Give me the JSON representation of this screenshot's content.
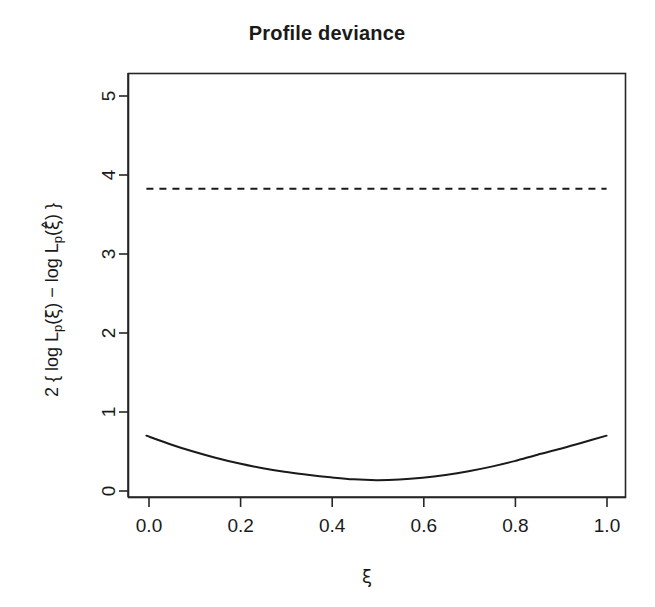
{
  "figure": {
    "title": "Profile deviance",
    "background_color": "#ffffff",
    "foreground_color": "#1a1a1a"
  },
  "axes": {
    "x_label_parts": {
      "symbol": "ξ"
    },
    "y_label_parts": {
      "p1": "2 { log L",
      "sub1": "p",
      "p2": "(",
      "g1": "ξ",
      "p3": ") − log L",
      "sub2": "p",
      "p4": "(",
      "g2": "ξ̂",
      "p5": ") }"
    },
    "x_ticks": [
      "0.0",
      "0.2",
      "0.4",
      "0.6",
      "0.8",
      "1.0"
    ],
    "y_ticks": [
      "0",
      "1",
      "2",
      "3",
      "4",
      "5"
    ]
  },
  "annotations": {
    "reference_line_label": "chi-square 95% critical value"
  },
  "chart_data": {
    "type": "line",
    "title": "Profile deviance",
    "xlabel": "ξ",
    "ylabel": "2 { log L_p(ξ) − log L_p(ξ̂) }",
    "xlim": [
      -0.04,
      1.04
    ],
    "ylim": [
      -0.18,
      5.35
    ],
    "xticks": [
      0.0,
      0.2,
      0.4,
      0.6,
      0.8,
      1.0
    ],
    "yticks": [
      0,
      1,
      2,
      3,
      4,
      5
    ],
    "xticklabels": [
      "0.0",
      "0.2",
      "0.4",
      "0.6",
      "0.8",
      "1.0"
    ],
    "yticklabels": [
      "0",
      "1",
      "2",
      "3",
      "4",
      "5"
    ],
    "grid": false,
    "legend": false,
    "series": [
      {
        "name": "profile deviance",
        "style": "solid",
        "color": "#1a1a1a",
        "x": [
          0.0,
          0.05,
          0.1,
          0.15,
          0.2,
          0.25,
          0.3,
          0.35,
          0.4,
          0.45,
          0.5,
          0.55,
          0.6,
          0.65,
          0.7,
          0.75,
          0.8,
          0.85,
          0.9,
          0.95,
          1.0
        ],
        "y": [
          0.62,
          0.512,
          0.416,
          0.332,
          0.259,
          0.198,
          0.148,
          0.11,
          0.077,
          0.05,
          0.04,
          0.048,
          0.072,
          0.108,
          0.156,
          0.216,
          0.288,
          0.372,
          0.45,
          0.535,
          0.62
        ]
      },
      {
        "name": "critical value",
        "style": "dashed",
        "color": "#1a1a1a",
        "x": [
          0.0,
          1.0
        ],
        "y": [
          3.84,
          3.84
        ]
      }
    ]
  }
}
